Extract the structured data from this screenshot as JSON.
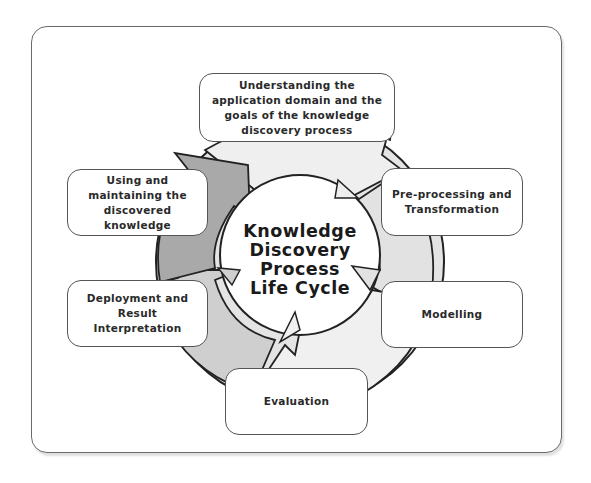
{
  "diagram": {
    "center_title": "Knowledge\nDiscovery\nProcess\nLife Cycle",
    "stages": [
      {
        "id": "understanding",
        "label": "Understanding the\napplication domain and the\ngoals of the knowledge\ndiscovery process"
      },
      {
        "id": "preprocessing",
        "label": "Pre-processing and\nTransformation"
      },
      {
        "id": "modelling",
        "label": "Modelling"
      },
      {
        "id": "evaluation",
        "label": "Evaluation"
      },
      {
        "id": "deployment",
        "label": "Deployment and\nResult\nInterpretation"
      },
      {
        "id": "using",
        "label": "Using and\nmaintaining the\ndiscovered\nknowledge"
      }
    ],
    "colors": {
      "ring_light": "#ececec",
      "ring_mid": "#d4d4d4",
      "ring_dark": "#a9a9a9",
      "outline": "#222222",
      "frame_border": "#6a6a6a"
    }
  }
}
